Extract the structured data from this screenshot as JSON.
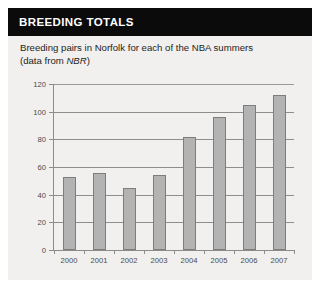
{
  "panel": {
    "header_title": "BREEDING TOTALS",
    "background_color": "#f1f0ee",
    "header_background_color": "#0b0b0b",
    "header_text_color": "#ffffff"
  },
  "subtitle": {
    "line1": "Breeding pairs in Norfolk for each of the NBA summers",
    "line2_prefix": "(data from ",
    "line2_italic": "NBR",
    "line2_suffix": ")"
  },
  "chart_data": {
    "type": "bar",
    "title": "Breeding pairs in Norfolk for each of the NBA summers",
    "subtitle": "(data from NBR)",
    "categories": [
      "2000",
      "2001",
      "2002",
      "2003",
      "2004",
      "2005",
      "2006",
      "2007"
    ],
    "values": [
      53,
      56,
      45,
      54,
      82,
      96,
      105,
      112
    ],
    "xlabel": "",
    "ylabel": "",
    "ylim": [
      0,
      120
    ],
    "yticks": [
      0,
      20,
      40,
      60,
      80,
      100,
      120
    ],
    "grid": true,
    "legend": false,
    "bar_fill_color": "#b3b3b3",
    "bar_border_color": "#7d7d7d",
    "axis_color": "#8b8b8b",
    "tick_label_color": "#4a4a4a"
  }
}
